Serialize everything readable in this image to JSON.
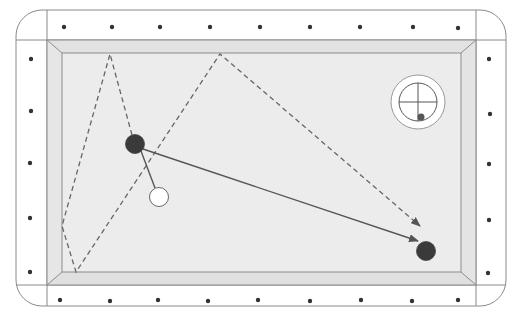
{
  "diagram": {
    "type": "billiards-shot-diagram",
    "colors": {
      "background": "#ffffff",
      "frame_line": "#8a8a8a",
      "rail_fill": "#ffffff",
      "cushion_fill": "#dedede",
      "cushion_line": "#8c8c8c",
      "felt_fill": "#ececec",
      "diamond": "#333333",
      "object_ball": "#3a3a3a",
      "cue_ball": "#ffffff",
      "path_line": "#555555",
      "dashed_line": "#666666"
    },
    "table": {
      "outer": {
        "x": 16,
        "y": 10,
        "w": 490,
        "h": 296,
        "radius": 26
      },
      "rail_inner": {
        "x": 47,
        "y": 40,
        "w": 429,
        "h": 245
      },
      "felt": {
        "x": 62,
        "y": 53,
        "w": 399,
        "h": 219
      }
    },
    "diamonds": {
      "top": [
        [
          64,
          27
        ],
        [
          112,
          27
        ],
        [
          160,
          27
        ],
        [
          210,
          27
        ],
        [
          260,
          27
        ],
        [
          310,
          27
        ],
        [
          360,
          27
        ],
        [
          413,
          27
        ],
        [
          458,
          28
        ]
      ],
      "bottom": [
        [
          60,
          300
        ],
        [
          110,
          301
        ],
        [
          158,
          300
        ],
        [
          208,
          301
        ],
        [
          258,
          300
        ],
        [
          310,
          301
        ],
        [
          361,
          300
        ],
        [
          412,
          301
        ],
        [
          458,
          300
        ]
      ],
      "left": [
        [
          31,
          59
        ],
        [
          31,
          111
        ],
        [
          30,
          163
        ],
        [
          30,
          218
        ],
        [
          30,
          272
        ]
      ],
      "right": [
        [
          489,
          59
        ],
        [
          490,
          114
        ],
        [
          489,
          164
        ],
        [
          489,
          220
        ],
        [
          488,
          273
        ]
      ]
    },
    "balls": [
      {
        "name": "object-ball-1",
        "cx": 135,
        "cy": 144,
        "r": 9.5,
        "fill": "#3a3a3a"
      },
      {
        "name": "cue-ball",
        "cx": 159,
        "cy": 197,
        "r": 9.5,
        "fill": "#ffffff"
      },
      {
        "name": "object-ball-2",
        "cx": 426,
        "cy": 251,
        "r": 9.5,
        "fill": "#3a3a3a"
      }
    ],
    "solid_paths": [
      {
        "name": "cue-ball-to-object-ball",
        "points": [
          [
            155,
            188
          ],
          [
            141,
            151
          ]
        ],
        "arrow": false
      },
      {
        "name": "object-ball-travel-path",
        "points": [
          [
            143,
            149
          ],
          [
            418,
            241
          ]
        ],
        "arrow": true
      }
    ],
    "dashed_paths": [
      {
        "name": "cue-ball-rail-path",
        "points": [
          [
            132,
            135
          ],
          [
            110,
            54
          ],
          [
            62,
            226
          ],
          [
            76,
            272
          ],
          [
            220,
            54
          ],
          [
            420,
            226
          ]
        ],
        "arrow": true
      }
    ],
    "spin_indicator": {
      "cx": 418,
      "cy": 102,
      "outer_r": 27,
      "inner_r": 19,
      "dot": {
        "cx": 421,
        "cy": 117,
        "r": 3.5
      },
      "label": "cue-ball-contact-point"
    }
  }
}
